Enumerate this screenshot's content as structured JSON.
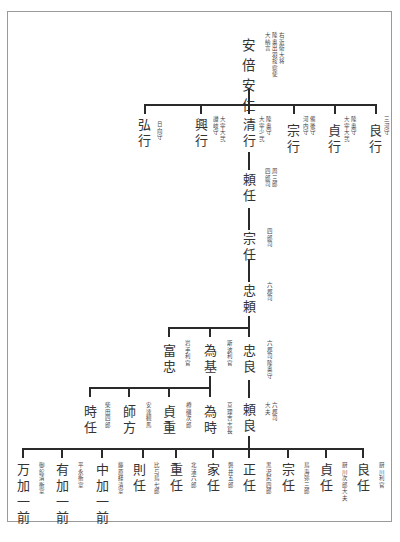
{
  "diagram": {
    "type": "genealogy-tree",
    "root": {
      "name": "安倍安仁",
      "note": [
        "右近衛大将",
        "陸奥出羽按察使",
        "大納言"
      ]
    },
    "gen2": [
      {
        "name": "弘行",
        "note": [
          "日向守"
        ]
      },
      {
        "name": "興行",
        "note": [
          "大宰大弐",
          "讃岐守"
        ]
      },
      {
        "name": "清行",
        "note": [
          "陸奥守",
          "大宰少弐"
        ]
      },
      {
        "name": "宗行",
        "note": [
          "備後守",
          "河内守"
        ]
      },
      {
        "name": "貞行",
        "note": [
          "陸奥守",
          "大宰大弐"
        ]
      },
      {
        "name": "良行",
        "note": [
          "三河守"
        ]
      }
    ],
    "main_line": [
      {
        "name": "頼任",
        "note": [
          "周三郎",
          "四郎司"
        ]
      },
      {
        "name": "宗任",
        "note": [
          "四郎司"
        ]
      },
      {
        "name": "忠頼",
        "note": [
          "六郡司"
        ]
      }
    ],
    "gen6": [
      {
        "name": "富忠",
        "note": [
          "岩手利官"
        ]
      },
      {
        "name": "為基",
        "note": [
          "斯波利官"
        ]
      },
      {
        "name": "忠良",
        "note": [
          "六郡司陸奥守"
        ]
      }
    ],
    "gen7": [
      {
        "name": "時任",
        "note": [
          "柴田四郎"
        ]
      },
      {
        "name": "師方",
        "note": [
          "安達観馬"
        ]
      },
      {
        "name": "貞重",
        "note": [
          "樽磯次郎"
        ]
      },
      {
        "name": "為時",
        "note": [
          "亘理吉志長"
        ]
      },
      {
        "name": "頼良",
        "note": [
          "六郡司",
          "大夫"
        ]
      }
    ],
    "gen8": [
      {
        "name": "万加一前",
        "note": [
          "御館清衡室"
        ]
      },
      {
        "name": "有加一前",
        "note": [
          "平永衡室"
        ]
      },
      {
        "name": "中加一前",
        "note": [
          "藤原経清室"
        ]
      },
      {
        "name": "則任",
        "note": [
          "比与鳥七郎"
        ]
      },
      {
        "name": "重任",
        "note": [
          "北浦六郎"
        ]
      },
      {
        "name": "家任",
        "note": [
          "磐井五郎"
        ]
      },
      {
        "name": "正任",
        "note": [
          "黒沢尻四郎"
        ]
      },
      {
        "name": "宗任",
        "note": [
          "鳥海弥三郎"
        ]
      },
      {
        "name": "貞任",
        "note": [
          "厨川次郎大夫"
        ]
      },
      {
        "name": "良任",
        "note": [
          "厨川利官"
        ]
      }
    ]
  }
}
